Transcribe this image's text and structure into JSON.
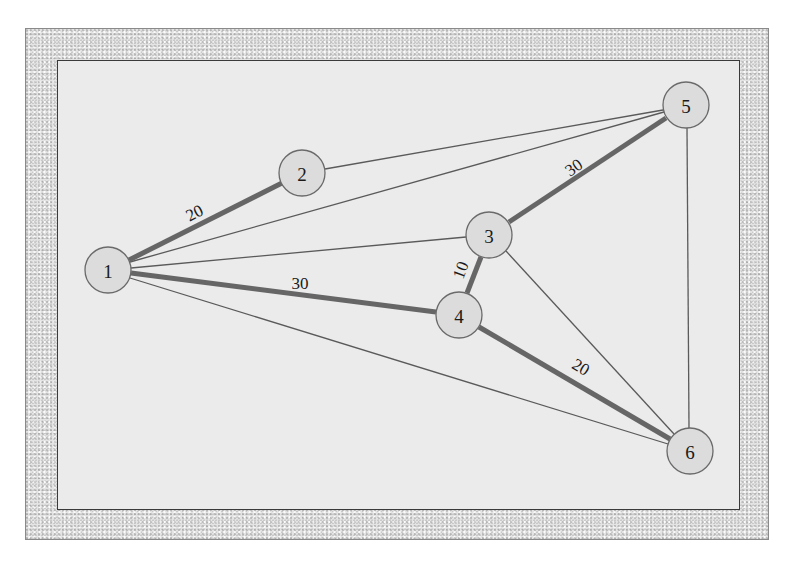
{
  "diagram": {
    "type": "weighted-undirected-graph",
    "nodes": [
      {
        "id": "1",
        "label": "1",
        "x": 108,
        "y": 270
      },
      {
        "id": "2",
        "label": "2",
        "x": 302,
        "y": 173
      },
      {
        "id": "3",
        "label": "3",
        "x": 489,
        "y": 235
      },
      {
        "id": "4",
        "label": "4",
        "x": 459,
        "y": 315
      },
      {
        "id": "5",
        "label": "5",
        "x": 686,
        "y": 105
      },
      {
        "id": "6",
        "label": "6",
        "x": 690,
        "y": 451
      }
    ],
    "edges": [
      {
        "from": "2",
        "to": "5",
        "highlighted": false,
        "weight": ""
      },
      {
        "from": "1",
        "to": "5",
        "highlighted": false,
        "weight": ""
      },
      {
        "from": "1",
        "to": "3",
        "highlighted": false,
        "weight": ""
      },
      {
        "from": "1",
        "to": "6",
        "highlighted": false,
        "weight": ""
      },
      {
        "from": "3",
        "to": "6",
        "highlighted": false,
        "weight": ""
      },
      {
        "from": "5",
        "to": "6",
        "highlighted": false,
        "weight": ""
      },
      {
        "from": "1",
        "to": "2",
        "highlighted": true,
        "weight": "20"
      },
      {
        "from": "1",
        "to": "4",
        "highlighted": true,
        "weight": "30"
      },
      {
        "from": "3",
        "to": "4",
        "highlighted": true,
        "weight": "10"
      },
      {
        "from": "3",
        "to": "5",
        "highlighted": true,
        "weight": "30"
      },
      {
        "from": "4",
        "to": "6",
        "highlighted": true,
        "weight": "20"
      }
    ],
    "edge_labels": {
      "e12": "20",
      "e14": "30",
      "e34": "10",
      "e35": "30",
      "e46": "20"
    },
    "colors": {
      "panel": "#ebebeb",
      "frame": "#e4e4e4",
      "node_fill": "#dcdcdc",
      "thick_edge": "#666666",
      "thin_edge": "#5a5a5a"
    }
  }
}
